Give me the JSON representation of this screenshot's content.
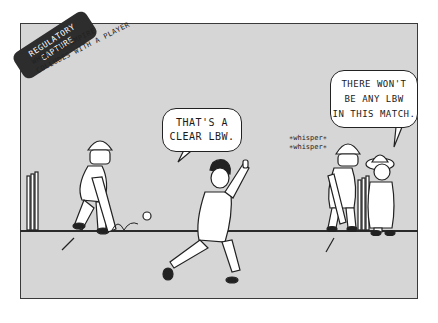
{
  "comic": {
    "title_tag": {
      "line1": "REGULATORY",
      "line2": "CAPTURE"
    },
    "subtitle": {
      "line1": "WHEN THE UMPIRE",
      "line2": "COLLUDES WITH A PLAYER"
    },
    "bowler_speech": {
      "line1": "THAT'S A",
      "line2": "CLEAR LBW."
    },
    "umpire_speech": {
      "line1": "THERE WON'T",
      "line2": "BE ANY LBW",
      "line3": "IN THIS MATCH."
    },
    "whisper": {
      "line1": "∗whisper∗",
      "line2": "∗whisper∗"
    },
    "colors": {
      "panel_background": "#d6d6d6",
      "outline": "#222222",
      "tag_background": "#2d2d2d",
      "bubble_background": "#ffffff"
    }
  }
}
